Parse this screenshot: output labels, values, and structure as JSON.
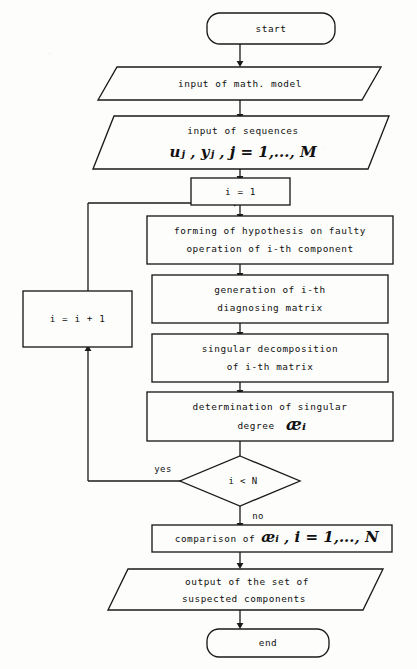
{
  "diagram": {
    "type": "flowchart",
    "title_visible": false,
    "nodes": [
      {
        "id": "start",
        "shape": "terminator",
        "lines": [
          "start"
        ]
      },
      {
        "id": "in-model",
        "shape": "io",
        "lines": [
          "input of math. model"
        ]
      },
      {
        "id": "in-seq",
        "shape": "io",
        "lines": [
          "input of sequences"
        ],
        "math_line": "uⱼ , yⱼ ,  j = 1,..., M"
      },
      {
        "id": "init",
        "shape": "process",
        "lines": [
          "i = 1"
        ]
      },
      {
        "id": "hypothesis",
        "shape": "process",
        "lines": [
          "forming of hypothesis on faulty",
          "operation of i-th component"
        ]
      },
      {
        "id": "generation",
        "shape": "process",
        "lines": [
          "generation of i-th",
          "diagnosing matrix"
        ]
      },
      {
        "id": "decomp",
        "shape": "process",
        "lines": [
          "singular decomposition",
          "of i-th matrix"
        ]
      },
      {
        "id": "degree",
        "shape": "process",
        "lines": [
          "determination of singular"
        ],
        "math_tail_prefix": "degree",
        "math_tail": "æᵢ"
      },
      {
        "id": "decision",
        "shape": "decision",
        "lines": [
          "i < N"
        ]
      },
      {
        "id": "increment",
        "shape": "process",
        "lines": [
          "i = i + 1"
        ]
      },
      {
        "id": "comparison",
        "shape": "process",
        "text_prefix": "comparison of",
        "math_tail": "æᵢ , i = 1,..., N"
      },
      {
        "id": "output",
        "shape": "io",
        "lines": [
          "output of the set of",
          "suspected components"
        ]
      },
      {
        "id": "end",
        "shape": "terminator",
        "lines": [
          "end"
        ]
      }
    ],
    "edge_labels": {
      "yes": "yes",
      "no": "no"
    },
    "texts": {
      "start": "start",
      "in_model": "input of math. model",
      "in_seq_line1": "input of sequences",
      "in_seq_math": "uⱼ , yⱼ ,  j = 1,..., M",
      "init": "i = 1",
      "hyp_line1": "forming of hypothesis on faulty",
      "hyp_line2": "operation of i-th component",
      "gen_line1": "generation of i-th",
      "gen_line2": "diagnosing matrix",
      "dec_line1": "singular decomposition",
      "dec_line2": "of i-th matrix",
      "deg_line1": "determination of singular",
      "deg_line2_word": "degree",
      "deg_line2_math": "æᵢ",
      "decision": "i < N",
      "increment": "i = i + 1",
      "comparison_word": "comparison of",
      "comparison_math": "æᵢ , i = 1,..., N",
      "out_line1": "output of the set of",
      "out_line2": "suspected components",
      "end": "end",
      "yes": "yes",
      "no": "no"
    },
    "colors": {
      "ink": "#1a1a1a",
      "paper": "#fdfdfb"
    }
  }
}
